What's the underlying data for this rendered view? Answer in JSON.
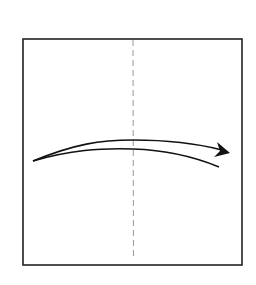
{
  "diagram": {
    "type": "origami-fold-step",
    "square": {
      "x1": 23,
      "y1": 39,
      "x2": 242,
      "y2": 265,
      "stroke": "#222222"
    },
    "fold_line": {
      "style": "dashed",
      "x": 133,
      "y1": 40,
      "y2": 260,
      "color": "#888888"
    },
    "arrow": {
      "direction": "left-to-right",
      "color": "#111111"
    }
  }
}
